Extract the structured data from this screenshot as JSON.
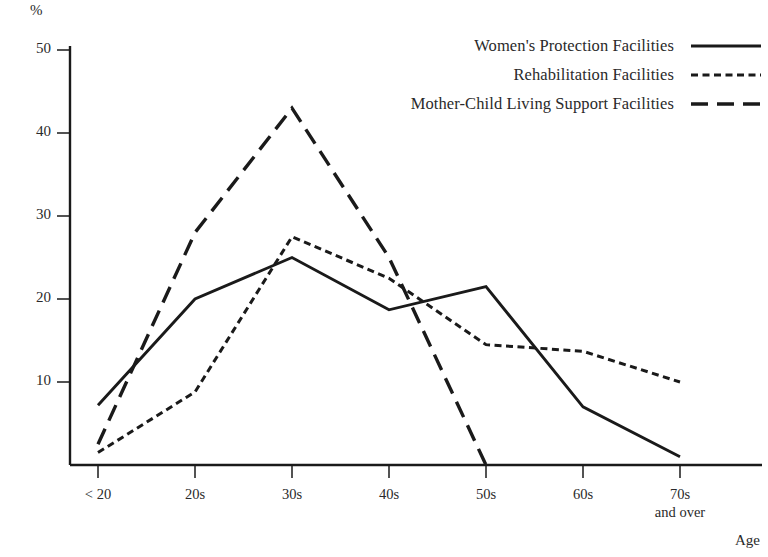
{
  "chart_data": {
    "type": "line",
    "title": "",
    "xlabel": "Age",
    "ylabel": "%",
    "categories": [
      "< 20",
      "20s",
      "30s",
      "40s",
      "50s",
      "60s",
      "70s\nand over"
    ],
    "ylim": [
      0,
      52
    ],
    "yticks": [
      10,
      20,
      30,
      40,
      50
    ],
    "grid": false,
    "legend_position": "top-right",
    "series": [
      {
        "name": "Women's Protection Facilities",
        "style": "solid",
        "values": [
          7.2,
          20.0,
          25.0,
          18.7,
          21.5,
          7.0,
          1.0
        ]
      },
      {
        "name": "Rehabilitation Facilities",
        "style": "dotted",
        "values": [
          1.5,
          8.8,
          27.5,
          22.5,
          14.5,
          13.7,
          10.0
        ]
      },
      {
        "name": "Mother-Child Living Support Facilities",
        "style": "dashed",
        "values": [
          2.5,
          28.0,
          43.0,
          25.0,
          0.0,
          null,
          null
        ]
      }
    ]
  },
  "axes": {
    "y_unit": "%",
    "x_title": "Age",
    "y_tick_labels": [
      "50",
      "40",
      "30",
      "20",
      "10"
    ],
    "x_tick_labels": [
      {
        "line1": "< 20",
        "line2": ""
      },
      {
        "line1": "20s",
        "line2": ""
      },
      {
        "line1": "30s",
        "line2": ""
      },
      {
        "line1": "40s",
        "line2": ""
      },
      {
        "line1": "50s",
        "line2": ""
      },
      {
        "line1": "60s",
        "line2": ""
      },
      {
        "line1": "70s",
        "line2": "and over"
      }
    ]
  },
  "legend": {
    "entries": [
      {
        "label": "Women's Protection Facilities",
        "style": "solid"
      },
      {
        "label": "Rehabilitation Facilities",
        "style": "dotted"
      },
      {
        "label": "Mother-Child Living Support Facilities",
        "style": "dashed"
      }
    ]
  },
  "colors": {
    "line": "#1a1a1a",
    "axis": "#1a1a1a",
    "text": "#2a2a2a",
    "background": "#ffffff"
  }
}
